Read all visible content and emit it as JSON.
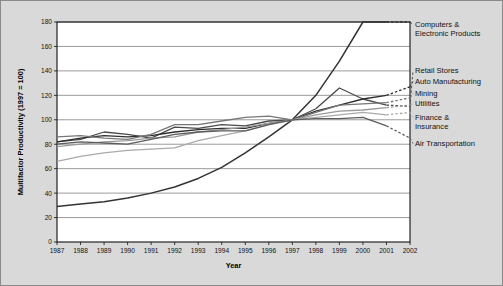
{
  "figure": {
    "background_color": "#d9d9d9",
    "plot_background_color": "#ffffff",
    "border_color": "#8a8a8a"
  },
  "chart_data": {
    "type": "line",
    "title": "",
    "xlabel": "Year",
    "ylabel": "Multifactor Productivity (1997 = 100)",
    "x": [
      1987,
      1988,
      1989,
      1990,
      1991,
      1992,
      1993,
      1994,
      1995,
      1996,
      1997,
      1998,
      1999,
      2000,
      2001,
      2002
    ],
    "xtick_labels": [
      "1987",
      "1988",
      "1989",
      "1990",
      "1991",
      "1992",
      "1993",
      "1994",
      "1995",
      "1996",
      "1997",
      "1998",
      "1999",
      "2000",
      "2001",
      "2002"
    ],
    "ylim": [
      0,
      180
    ],
    "yticks": [
      0,
      20,
      40,
      60,
      80,
      100,
      120,
      140,
      160,
      180
    ],
    "ytick_labels": [
      "0",
      "20",
      "40",
      "60",
      "80",
      "100",
      "120",
      "140",
      "160",
      "180"
    ],
    "grid": "horizontal",
    "legend_position": "right-outside",
    "dashed_tail_from": 2001,
    "series": [
      {
        "name": "Computers & Electronic Products",
        "color": "#333333",
        "width": 1.5,
        "values": [
          29,
          31,
          33,
          36,
          40,
          45,
          52,
          61,
          73,
          86,
          100,
          120,
          148,
          180,
          181,
          181
        ],
        "clipped_at_top": true,
        "label_lines": [
          "Computers &",
          "Electronic Products"
        ],
        "label_y": 26
      },
      {
        "name": "Retail Stores",
        "color": "#4a4a4a",
        "width": 1.3,
        "values": [
          82,
          84,
          90,
          88,
          85,
          94,
          93,
          96,
          95,
          99,
          100,
          109,
          126,
          117,
          112,
          111
        ],
        "label_lines": [
          "Retail Stores"
        ],
        "label_y": 72
      },
      {
        "name": "Auto Manufacturing",
        "color": "#2e2e2e",
        "width": 1.3,
        "values": [
          82,
          85,
          87,
          86,
          87,
          90,
          92,
          93,
          93,
          97,
          100,
          107,
          112,
          117,
          120,
          127
        ],
        "label_lines": [
          "Auto Manufacturing"
        ],
        "label_y": 83
      },
      {
        "name": "Mining",
        "color": "#777777",
        "width": 1.3,
        "values": [
          86,
          87,
          85,
          84,
          88,
          96,
          96,
          99,
          102,
          103,
          100,
          106,
          112,
          113,
          114,
          118
        ],
        "label_lines": [
          "Mining"
        ],
        "label_y": 95
      },
      {
        "name": "Utilities",
        "color": "#999999",
        "width": 1.3,
        "values": [
          78,
          80,
          82,
          83,
          85,
          86,
          90,
          92,
          94,
          97,
          100,
          104,
          107,
          108,
          110,
          112
        ],
        "label_lines": [
          "Utilities"
        ],
        "label_y": 105
      },
      {
        "name": "Finance & Insurance",
        "color": "#aaaaaa",
        "width": 1.3,
        "values": [
          66,
          70,
          73,
          75,
          76,
          77,
          83,
          87,
          91,
          96,
          100,
          102,
          104,
          106,
          104,
          106
        ],
        "label_lines": [
          "Finance &",
          "Insurance"
        ],
        "label_y": 119
      },
      {
        "name": "Air Transportation",
        "color": "#5c5c5c",
        "width": 1.3,
        "values": [
          80,
          82,
          81,
          80,
          84,
          88,
          90,
          91,
          91,
          96,
          100,
          101,
          101,
          102,
          95,
          85
        ],
        "label_lines": [
          "Air Transportation"
        ],
        "label_y": 145
      }
    ]
  }
}
